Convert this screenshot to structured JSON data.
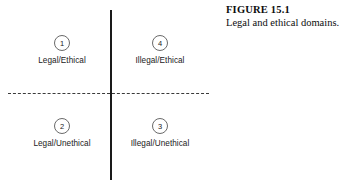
{
  "figure": {
    "caption_title": "FIGURE 15.1",
    "caption_text": "Legal and ethical domains."
  },
  "diagram": {
    "type": "two-by-two-quadrant-matrix",
    "vertical_axis_style": "solid",
    "horizontal_axis_style": "dashed",
    "line_color": "#1a1a1a",
    "quadrants": [
      {
        "number": "1",
        "label": "Legal/Ethical",
        "position": "top-left"
      },
      {
        "number": "4",
        "label": "Illegal/Ethical",
        "position": "top-right"
      },
      {
        "number": "2",
        "label": "Legal/Unethical",
        "position": "bottom-left"
      },
      {
        "number": "3",
        "label": "Illegal/Unethical",
        "position": "bottom-right"
      }
    ]
  }
}
